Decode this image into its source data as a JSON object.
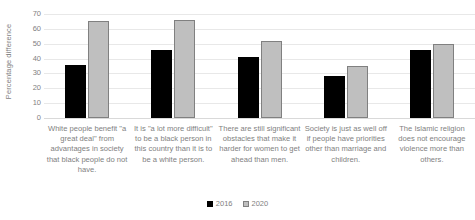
{
  "chart_data": {
    "type": "bar",
    "title": "",
    "xlabel": "",
    "ylabel": "Percentage difference",
    "ylim": [
      0,
      70
    ],
    "ytick_step": 10,
    "yticks": [
      70,
      60,
      50,
      40,
      30,
      20,
      10,
      0
    ],
    "grid": true,
    "legend_position": "bottom",
    "categories": [
      "White people benefit \"a great deal\" from advantages in society that black people do not have.",
      "It is \"a lot more difficult\" to be a black person in this country than it is to be a white person.",
      "There are still significant obstacles that make it harder for women to get ahead than men.",
      "Society is just as well off if people have priorities other than marriage and children.",
      "The Islamic religion does not encourage violence more than others."
    ],
    "series": [
      {
        "name": "2016",
        "color": "#000000",
        "values": [
          36,
          46,
          41,
          28,
          46
        ]
      },
      {
        "name": "2020",
        "color": "#bfbfbf",
        "values": [
          65,
          66,
          52,
          35,
          50
        ]
      }
    ]
  },
  "legend": {
    "items": [
      {
        "label": "2016"
      },
      {
        "label": "2020"
      }
    ]
  }
}
